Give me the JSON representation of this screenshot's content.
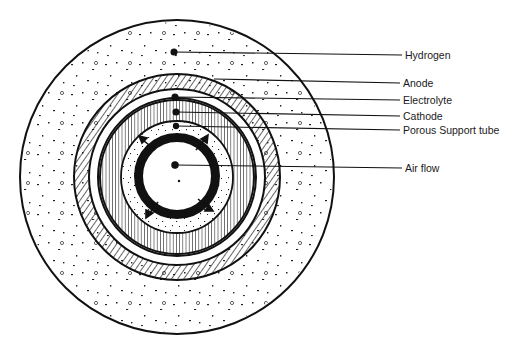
{
  "diagram": {
    "labels": [
      {
        "id": "hydrogen",
        "text": "Hydrogen",
        "x": 405,
        "y": 49
      },
      {
        "id": "anode",
        "text": "Anode",
        "x": 403,
        "y": 77
      },
      {
        "id": "electrolyte",
        "text": "Electrolyte",
        "x": 403,
        "y": 94
      },
      {
        "id": "cathode",
        "text": "Cathode",
        "x": 403,
        "y": 110
      },
      {
        "id": "porous-support-tube",
        "text": "Porous Support tube",
        "x": 403,
        "y": 124
      },
      {
        "id": "air-flow",
        "text": "Air flow",
        "x": 405,
        "y": 162
      }
    ],
    "colors": {
      "ink": "#111111",
      "background": "#ffffff"
    }
  }
}
